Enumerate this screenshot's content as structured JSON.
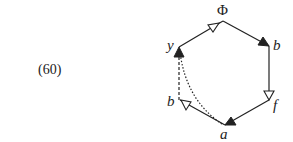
{
  "equation_number": "(60)",
  "diagram": {
    "type": "hexagon-graph",
    "nodes": [
      {
        "id": "top",
        "label": "Φ"
      },
      {
        "id": "upper_right",
        "label": "b"
      },
      {
        "id": "lower_right",
        "label": "f"
      },
      {
        "id": "bottom",
        "label": "a"
      },
      {
        "id": "lower_left",
        "label": "b"
      },
      {
        "id": "upper_left",
        "label": "y"
      }
    ],
    "edges": [
      {
        "from": "upper_left",
        "to": "top",
        "style": "solid",
        "arrow": "open"
      },
      {
        "from": "top",
        "to": "upper_right",
        "style": "solid",
        "arrow": "filled"
      },
      {
        "from": "upper_right",
        "to": "lower_right",
        "style": "solid",
        "arrow": "open"
      },
      {
        "from": "lower_right",
        "to": "bottom",
        "style": "solid",
        "arrow": "filled"
      },
      {
        "from": "bottom",
        "to": "lower_left",
        "style": "solid",
        "arrow": "open"
      },
      {
        "from": "lower_left",
        "to": "upper_left",
        "style": "dashed",
        "arrow": "filled"
      },
      {
        "from": "bottom",
        "to": "upper_left",
        "style": "dotted-curve",
        "arrow": "none"
      }
    ],
    "colors": {
      "stroke": "#222222",
      "background": "#ffffff"
    }
  }
}
